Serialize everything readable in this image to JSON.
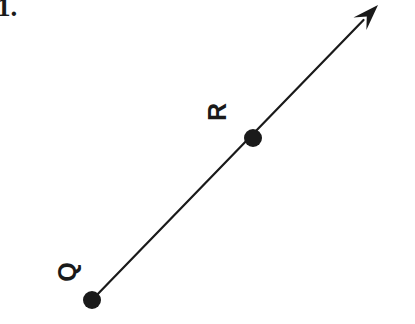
{
  "figure": {
    "problem_number": "1.",
    "background_color": "#ffffff",
    "ink_color": "#1a1a1a",
    "description_type": "ray-through-two-points",
    "points": [
      {
        "id": "Q",
        "label": "Q",
        "x": 92,
        "y": 300,
        "dot_radius": 9,
        "label_rotation_deg": -90,
        "label_x": 68,
        "label_y": 272
      },
      {
        "id": "R",
        "label": "R",
        "x": 253,
        "y": 138,
        "dot_radius": 9,
        "label_rotation_deg": -90,
        "label_x": 218,
        "label_y": 112
      }
    ],
    "ray": {
      "start_x": 92,
      "start_y": 300,
      "end_x": 378,
      "end_y": 5,
      "stroke_width": 2.2,
      "arrow_at_end": true,
      "arrow_at_start": false,
      "arrow_length": 26,
      "arrow_half_width": 9
    }
  }
}
